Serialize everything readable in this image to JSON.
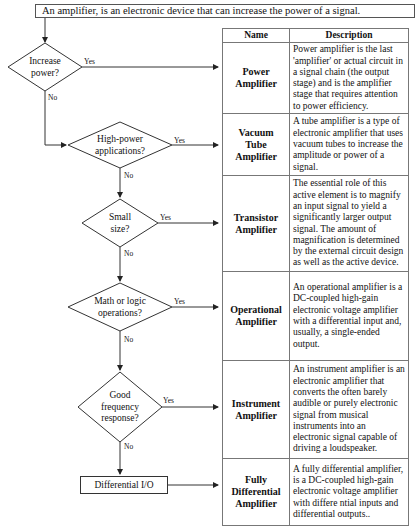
{
  "title": "An amplifier,  is an electronic device that can increase the power of a signal.",
  "flowchart": {
    "decisions": [
      {
        "label_lines": [
          "Increase",
          "power?"
        ],
        "yes": "Yes",
        "no": "No"
      },
      {
        "label_lines": [
          "High-power",
          "applications?"
        ],
        "yes": "Yes",
        "no": "No"
      },
      {
        "label_lines": [
          "Small",
          "size?"
        ],
        "yes": "Yes",
        "no": "No"
      },
      {
        "label_lines": [
          "Math or logic",
          "operations?"
        ],
        "yes": "Yes",
        "no": "No"
      },
      {
        "label_lines": [
          "Good",
          "frequency",
          "response?"
        ],
        "yes": "Yes",
        "no": "No"
      }
    ],
    "terminal": "Differential I/O"
  },
  "table": {
    "headers": [
      "Name",
      "Description"
    ],
    "rows": [
      {
        "name_lines": [
          "Power",
          "Amplifier"
        ],
        "description": "Power amplifier is the last 'amplifier' or actual circuit in a signal chain (the output stage) and is the amplifier stage that requires attention to power efficiency."
      },
      {
        "name_lines": [
          "Vacuum",
          "Tube",
          "Amplifier"
        ],
        "description": "A tube amplifier is a type of electronic amplifier that uses vacuum tubes to increase the amplitude or power of a signal."
      },
      {
        "name_lines": [
          "Transistor",
          "Amplifier"
        ],
        "description": "The essential role of this active element is to magnify an input signal to yield a significantly larger output signal. The amount of magnification is determined by the external circuit design as well as the active device."
      },
      {
        "name_lines": [
          "Operational",
          "Amplifier"
        ],
        "description": "An operational amplifier is a DC-coupled high-gain electronic voltage amplifier with a differential input and, usually, a single-ended output."
      },
      {
        "name_lines": [
          "Instrument",
          "Amplifier"
        ],
        "description": "An instrument amplifier is an electronic amplifier that converts the often barely audible or purely electronic signal from musical instruments into an electronic signal capable of driving a loudspeaker."
      },
      {
        "name_lines": [
          "Fully",
          "Differential",
          "Amplifier"
        ],
        "description": "A fully differential amplifier, is a DC-coupled high-gain electronic voltage amplifier with differe ntial inputs and differential outputs.."
      }
    ]
  }
}
